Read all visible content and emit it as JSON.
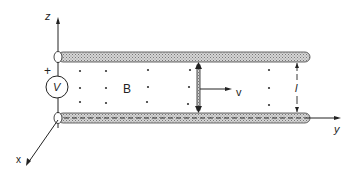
{
  "diagram": {
    "axes": {
      "z": "z",
      "x": "x",
      "y": "y"
    },
    "source": {
      "label": "V",
      "polarity": "+"
    },
    "field": {
      "label": "B"
    },
    "velocity": {
      "label": "v"
    },
    "separation": {
      "label": "l"
    },
    "colors": {
      "ink": "#222222",
      "rail_fill": "#bdbdbd"
    }
  }
}
